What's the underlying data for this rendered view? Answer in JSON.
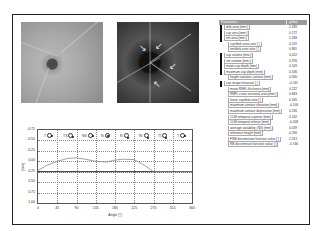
{
  "table": {
    "headers": [
      "Parameters",
      "global"
    ],
    "rows": [
      {
        "label": "disk area [mm²]",
        "value": "1.439",
        "mark": true,
        "indent": false
      },
      {
        "label": "cup area [mm²]",
        "value": "0.172",
        "mark": true,
        "indent": false
      },
      {
        "label": "rim area [mm²]",
        "value": "1.268",
        "mark": true,
        "indent": false
      },
      {
        "label": "cup/disk area ratio [ ]",
        "value": "0.119",
        "mark": false,
        "indent": true
      },
      {
        "label": "rim/disk area ratio [ ]",
        "value": "0.881",
        "mark": false,
        "indent": true
      },
      {
        "label": "cup volume [mm³]",
        "value": "0.022",
        "mark": true,
        "indent": false
      },
      {
        "label": "rim volume [mm³]",
        "value": "0.376",
        "mark": true,
        "indent": false
      },
      {
        "label": "mean cup depth [mm]",
        "value": "0.169",
        "mark": true,
        "indent": false
      },
      {
        "label": "maximum cup depth [mm]",
        "value": "0.536",
        "mark": true,
        "indent": false
      },
      {
        "label": "height variation contour [mm]",
        "value": "0.340",
        "mark": false,
        "indent": true
      },
      {
        "label": "cup shape measure [ ]",
        "value": "-0.241",
        "mark": true,
        "indent": false
      },
      {
        "label": "mean RNFL thickness [mm]",
        "value": "0.222",
        "mark": false,
        "indent": true
      },
      {
        "label": "RNFL cross sectional area [mm²]",
        "value": "0.843",
        "mark": false,
        "indent": true
      },
      {
        "label": "linear cup/disk ratio [ ]",
        "value": "0.345",
        "mark": false,
        "indent": true
      },
      {
        "label": "maximum contour elevation [mm]",
        "value": "-0.106",
        "mark": false,
        "indent": true
      },
      {
        "label": "maximum contour depression [mm]",
        "value": "0.236",
        "mark": false,
        "indent": true
      },
      {
        "label": "CLM temporal-superior [mm]",
        "value": "0.242",
        "mark": false,
        "indent": true
      },
      {
        "label": "CLM temporal-inferior [mm]",
        "value": "-0.058",
        "mark": false,
        "indent": true
      },
      {
        "label": "average variability (SD) [mm]",
        "value": "0.039",
        "mark": false,
        "indent": true
      },
      {
        "label": "reference height [mm]",
        "value": "0.296",
        "mark": false,
        "indent": true
      },
      {
        "label": "FSM discriminant function value [ ]",
        "value": "2.313",
        "mark": false,
        "indent": true
      },
      {
        "label": "RB discriminant function value [ ]",
        "value": "-0.746",
        "mark": false,
        "indent": true
      }
    ]
  },
  "images": {
    "left": "topography-image",
    "right": "reflectance-image"
  },
  "chart_data": {
    "type": "line",
    "title": "",
    "xlabel": "Angle [°]",
    "ylabel": "[mm]",
    "x_ticks": [
      "0",
      "45",
      "90",
      "135",
      "180",
      "225",
      "270",
      "315",
      "360"
    ],
    "y_ticks": [
      "-0.75",
      "-0.50",
      "-0.25",
      "0.00",
      "0.25",
      "0.50",
      "0.75",
      "1.00"
    ],
    "xlim": [
      0,
      360
    ],
    "ylim": [
      -0.75,
      1.0
    ],
    "y_inverted": true,
    "grid": true,
    "sector_markers": [
      "T",
      "TS",
      "NS",
      "N",
      "N",
      "NI",
      "TI",
      "T"
    ],
    "reference_line": 0.25,
    "series": [
      {
        "name": "height profile",
        "x": [
          0,
          20,
          45,
          70,
          90,
          110,
          135,
          160,
          180,
          200,
          225,
          250,
          270,
          300,
          330,
          360
        ],
        "values": [
          0.22,
          0.1,
          0.0,
          -0.07,
          -0.08,
          -0.05,
          0.0,
          0.02,
          -0.03,
          -0.05,
          -0.04,
          0.1,
          0.25,
          0.25,
          0.25,
          0.25
        ]
      }
    ]
  }
}
